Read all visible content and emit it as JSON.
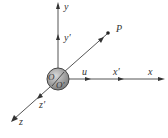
{
  "diagram": {
    "type": "coordinate-frames",
    "labels": {
      "y": "y",
      "y_prime": "y′",
      "x": "x",
      "x_prime": "x′",
      "z": "z",
      "z_prime": "z′",
      "velocity": "u",
      "point": "P",
      "origin": "O",
      "origin_prime": "O′"
    },
    "colors": {
      "axis": "#555555",
      "origin_fill": "#9a9a9a",
      "origin_stroke": "#444444",
      "label": "#333333"
    }
  }
}
